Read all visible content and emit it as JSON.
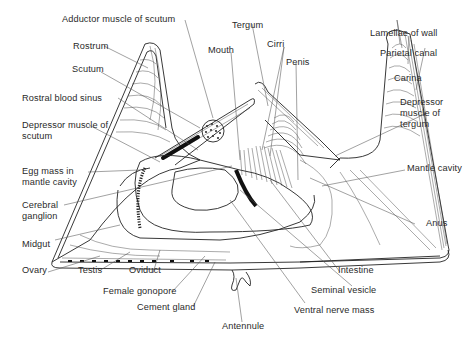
{
  "figure": {
    "labels": {
      "adductor_muscle_of_scutum": "Adductor muscle of scutum",
      "tergum": "Tergum",
      "rostrum": "Rostrum",
      "mouth": "Mouth",
      "cirri": "Cirri",
      "scutum": "Scutum",
      "penis": "Penis",
      "lamellae_of_wall": "Lamellae of wall",
      "parietal_canal": "Parietal canal",
      "carina": "Carina",
      "rostral_blood_sinus": "Rostral blood sinus",
      "depressor_muscle_of_scutum": "Depressor muscle of scutum",
      "depressor_muscle_of_tergum": "Depressor muscle of tergum",
      "egg_mass_in_mantle_cavity": "Egg mass in mantle cavity",
      "mantle_cavity": "Mantle cavity",
      "cerebral_ganglion": "Cerebral ganglion",
      "anus": "Anus",
      "midgut": "Midgut",
      "ovary": "Ovary",
      "testis": "Testis",
      "oviduct": "Oviduct",
      "intestine": "Intestine",
      "female_gonopore": "Female gonopore",
      "seminal_vesicle": "Seminal vesicle",
      "cement_gland": "Cement gland",
      "ventral_nerve_mass": "Ventral nerve mass",
      "antennule": "Antennule"
    },
    "colors": {
      "background": "#ffffff",
      "line": "#222222",
      "text": "#2a2a2a"
    }
  }
}
